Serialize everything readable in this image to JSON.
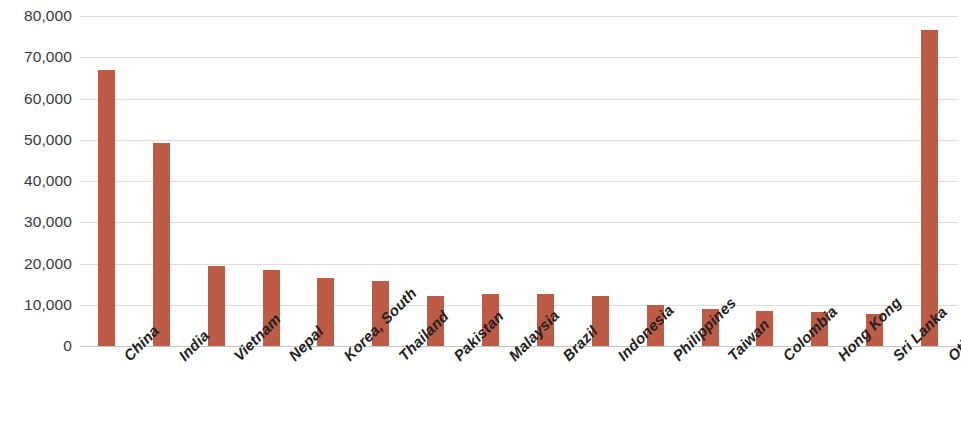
{
  "chart_data": {
    "type": "bar",
    "title": "",
    "subtitle": "",
    "xlabel": "",
    "ylabel": "",
    "ylim": [
      0,
      80000
    ],
    "ytick_step": 10000,
    "grid": true,
    "legend": false,
    "orientation": "vertical",
    "bar_color": "#bd5b45",
    "categories": [
      "China",
      "India",
      "Vietnam",
      "Nepal",
      "Korea, South",
      "Thailand",
      "Pakistan",
      "Malaysia",
      "Brazil",
      "Indonesia",
      "Philippines",
      "Taiwan",
      "Colombia",
      "Hong Kong",
      "Sri Lanka",
      "Other Countries"
    ],
    "values": [
      66800,
      49200,
      19500,
      18400,
      16400,
      15700,
      12200,
      12500,
      12500,
      12100,
      10000,
      8900,
      8500,
      8300,
      7800,
      76500
    ],
    "ytick_labels": [
      "80,000",
      "70,000",
      "60,000",
      "50,000",
      "40,000",
      "30,000",
      "20,000",
      "10,000",
      "0"
    ],
    "ytick_values": [
      80000,
      70000,
      60000,
      50000,
      40000,
      30000,
      20000,
      10000,
      0
    ]
  }
}
